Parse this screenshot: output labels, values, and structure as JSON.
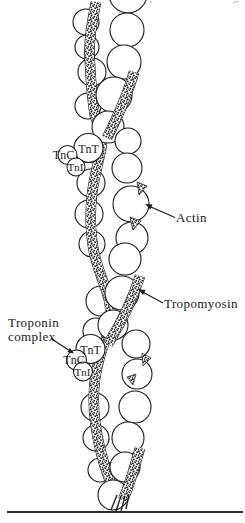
{
  "diagram": {
    "type": "muscle-thin-filament-structure",
    "background_color": "#ffffff",
    "ink_color": "#1a1a1a",
    "labels": {
      "actin": "Actin",
      "tropomyosin": "Tropomyosin",
      "troponin_complex_line1": "Troponin",
      "troponin_complex_line2": "complex",
      "troponin_T": "TnT",
      "troponin_C": "TnC",
      "troponin_I": "TnI"
    },
    "components": [
      "actin-monomer-beads",
      "tropomyosin-strands",
      "upper-troponin-complex",
      "lower-troponin-complex"
    ]
  }
}
